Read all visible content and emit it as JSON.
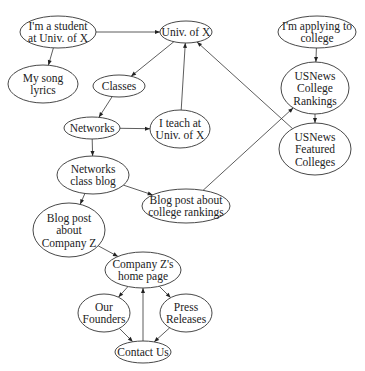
{
  "diagram": {
    "type": "directed-graph",
    "colors": {
      "stroke": "#333333",
      "text": "#222222",
      "background": "#ffffff"
    },
    "nodes": [
      {
        "id": "student",
        "lines": [
          "I'm a student",
          "at Univ. of X"
        ],
        "cx": 58,
        "cy": 32,
        "rx": 38,
        "ry": 16
      },
      {
        "id": "univ",
        "lines": [
          "Univ. of X"
        ],
        "cx": 186,
        "cy": 32,
        "rx": 26,
        "ry": 11
      },
      {
        "id": "applying",
        "lines": [
          "I'm applying to",
          "college"
        ],
        "cx": 317,
        "cy": 32,
        "rx": 39,
        "ry": 16
      },
      {
        "id": "songs",
        "lines": [
          "My song",
          "lyrics"
        ],
        "cx": 43,
        "cy": 84,
        "rx": 35,
        "ry": 19
      },
      {
        "id": "classes",
        "lines": [
          "Classes"
        ],
        "cx": 119,
        "cy": 86,
        "rx": 26,
        "ry": 11
      },
      {
        "id": "rankings",
        "lines": [
          "USNews",
          "College",
          "Rankings"
        ],
        "cx": 315,
        "cy": 88,
        "rx": 34,
        "ry": 26
      },
      {
        "id": "networks",
        "lines": [
          "Networks"
        ],
        "cx": 92,
        "cy": 128,
        "rx": 28,
        "ry": 11
      },
      {
        "id": "teach",
        "lines": [
          "I teach at",
          "Univ. of X"
        ],
        "cx": 180,
        "cy": 129,
        "rx": 30,
        "ry": 19
      },
      {
        "id": "featured",
        "lines": [
          "USNews",
          "Featured",
          "Colleges"
        ],
        "cx": 315,
        "cy": 149,
        "rx": 36,
        "ry": 26
      },
      {
        "id": "netblog",
        "lines": [
          "Networks",
          "class blog"
        ],
        "cx": 93,
        "cy": 175,
        "rx": 36,
        "ry": 19
      },
      {
        "id": "blogrank",
        "lines": [
          "Blog post about",
          "college rankings"
        ],
        "cx": 186,
        "cy": 206,
        "rx": 44,
        "ry": 17
      },
      {
        "id": "blogz",
        "lines": [
          "Blog post",
          "about",
          "Company Z"
        ],
        "cx": 69,
        "cy": 230,
        "rx": 36,
        "ry": 27
      },
      {
        "id": "homez",
        "lines": [
          "Company Z's",
          "home page"
        ],
        "cx": 143,
        "cy": 270,
        "rx": 38,
        "ry": 18
      },
      {
        "id": "founders",
        "lines": [
          "Our",
          "Founders"
        ],
        "cx": 104,
        "cy": 313,
        "rx": 26,
        "ry": 19
      },
      {
        "id": "press",
        "lines": [
          "Press",
          "Releases"
        ],
        "cx": 186,
        "cy": 313,
        "rx": 26,
        "ry": 19
      },
      {
        "id": "contact",
        "lines": [
          "Contact Us"
        ],
        "cx": 143,
        "cy": 352,
        "rx": 28,
        "ry": 11
      }
    ],
    "edges": [
      {
        "from": "student",
        "to": "univ"
      },
      {
        "from": "student",
        "to": "songs"
      },
      {
        "from": "univ",
        "to": "classes"
      },
      {
        "from": "classes",
        "to": "networks"
      },
      {
        "from": "networks",
        "to": "teach"
      },
      {
        "from": "teach",
        "to": "univ"
      },
      {
        "from": "networks",
        "to": "netblog"
      },
      {
        "from": "netblog",
        "to": "blogrank"
      },
      {
        "from": "netblog",
        "to": "blogz"
      },
      {
        "from": "blogrank",
        "to": "rankings"
      },
      {
        "from": "featured",
        "to": "univ"
      },
      {
        "from": "applying",
        "to": "rankings"
      },
      {
        "from": "rankings",
        "to": "featured"
      },
      {
        "from": "blogz",
        "to": "homez"
      },
      {
        "from": "homez",
        "to": "founders"
      },
      {
        "from": "homez",
        "to": "press"
      },
      {
        "from": "founders",
        "to": "contact"
      },
      {
        "from": "press",
        "to": "contact"
      },
      {
        "from": "contact",
        "to": "homez"
      }
    ]
  }
}
